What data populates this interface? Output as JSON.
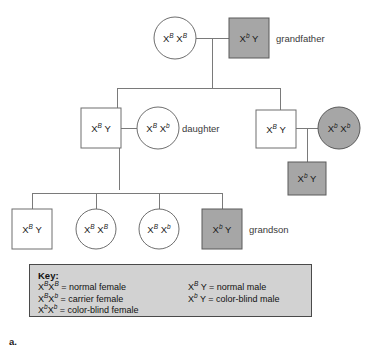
{
  "figure": {
    "label": "a.",
    "type": "pedigree-chart",
    "trait": "color blindness (X-linked recessive)"
  },
  "colors": {
    "affected_fill": "#a6a6a6",
    "unaffected_fill": "#ffffff",
    "shape_stroke": "#6e6e6e",
    "line": "#7a7a7a",
    "key_background": "#d2d2d2",
    "key_border": "#4a4a4a"
  },
  "pedigree": {
    "generations": [
      {
        "name": "generation-1",
        "individuals": [
          {
            "id": "g1-grandmother",
            "sex": "female",
            "shape": "circle",
            "affected": false,
            "allele1": "X",
            "sup1": "B",
            "allele2": "X",
            "sup2": "B",
            "genotype_text": "X^B X^B",
            "role_label": ""
          },
          {
            "id": "g1-grandfather",
            "sex": "male",
            "shape": "square",
            "affected": true,
            "allele1": "X",
            "sup1": "b",
            "allele2": "Y",
            "sup2": "",
            "genotype_text": "X^b Y",
            "role_label": "grandfather"
          }
        ]
      },
      {
        "name": "generation-2",
        "individuals": [
          {
            "id": "g2-son-in-law",
            "sex": "male",
            "shape": "square",
            "affected": false,
            "allele1": "X",
            "sup1": "B",
            "allele2": "Y",
            "sup2": "",
            "genotype_text": "X^B Y",
            "role_label": ""
          },
          {
            "id": "g2-daughter",
            "sex": "female",
            "shape": "circle",
            "affected": false,
            "allele1": "X",
            "sup1": "B",
            "allele2": "X",
            "sup2": "b",
            "genotype_text": "X^B X^b",
            "role_label": "daughter"
          },
          {
            "id": "g2-son",
            "sex": "male",
            "shape": "square",
            "affected": false,
            "allele1": "X",
            "sup1": "B",
            "allele2": "Y",
            "sup2": "",
            "genotype_text": "X^B Y",
            "role_label": ""
          },
          {
            "id": "g2-daughter-in-law",
            "sex": "female",
            "shape": "circle",
            "affected": true,
            "allele1": "X",
            "sup1": "b",
            "allele2": "X",
            "sup2": "b",
            "genotype_text": "X^b X^b",
            "role_label": ""
          }
        ]
      },
      {
        "name": "generation-3",
        "individuals": [
          {
            "id": "g3-child-1",
            "sex": "male",
            "shape": "square",
            "affected": false,
            "allele1": "X",
            "sup1": "B",
            "allele2": "Y",
            "sup2": "",
            "genotype_text": "X^B Y",
            "role_label": ""
          },
          {
            "id": "g3-child-2",
            "sex": "female",
            "shape": "circle",
            "affected": false,
            "allele1": "X",
            "sup1": "B",
            "allele2": "X",
            "sup2": "B",
            "genotype_text": "X^B X^B",
            "role_label": ""
          },
          {
            "id": "g3-child-3",
            "sex": "female",
            "shape": "circle",
            "affected": false,
            "allele1": "X",
            "sup1": "B",
            "allele2": "X",
            "sup2": "b",
            "genotype_text": "X^B X^b",
            "role_label": ""
          },
          {
            "id": "g3-grandson",
            "sex": "male",
            "shape": "square",
            "affected": true,
            "allele1": "X",
            "sup1": "b",
            "allele2": "Y",
            "sup2": "",
            "genotype_text": "X^b Y",
            "role_label": "grandson"
          },
          {
            "id": "g3-nephew",
            "sex": "male",
            "shape": "square",
            "affected": true,
            "allele1": "X",
            "sup1": "b",
            "allele2": "Y",
            "sup2": "",
            "genotype_text": "X^b Y",
            "role_label": ""
          }
        ]
      }
    ]
  },
  "key": {
    "title": "Key:",
    "left_column": [
      {
        "allele1": "X",
        "sup1": "B",
        "allele2": "X",
        "sup2": "B",
        "equals": "= normal female"
      },
      {
        "allele1": "X",
        "sup1": "B",
        "allele2": "X",
        "sup2": "b",
        "equals": "= carrier female"
      },
      {
        "allele1": "X",
        "sup1": "b",
        "allele2": "X",
        "sup2": "b",
        "equals": "= color-blind female"
      }
    ],
    "right_column": [
      {
        "allele1": "X",
        "sup1": "B",
        "allele2": "Y",
        "sup2": "",
        "equals": "= normal male"
      },
      {
        "allele1": "X",
        "sup1": "b",
        "allele2": "Y",
        "sup2": "",
        "equals": "= color-blind male"
      }
    ]
  }
}
